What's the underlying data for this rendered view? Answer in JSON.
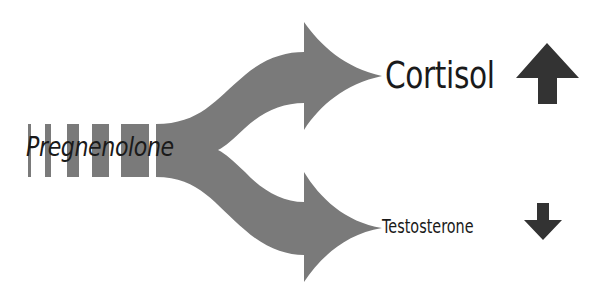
{
  "diagram": {
    "title": "",
    "colors": {
      "flow": "#7a7a7a",
      "indicator": "#333333",
      "text": "#1a1a1a",
      "background": "#ffffff"
    },
    "source": {
      "label": "Pregnenolone"
    },
    "products": [
      {
        "label": "Cortisol",
        "direction": "up",
        "indicator_icon": "arrow-up-icon",
        "emphasis": "large"
      },
      {
        "label": "Testosterone",
        "direction": "down",
        "indicator_icon": "arrow-down-icon",
        "emphasis": "small"
      }
    ]
  }
}
